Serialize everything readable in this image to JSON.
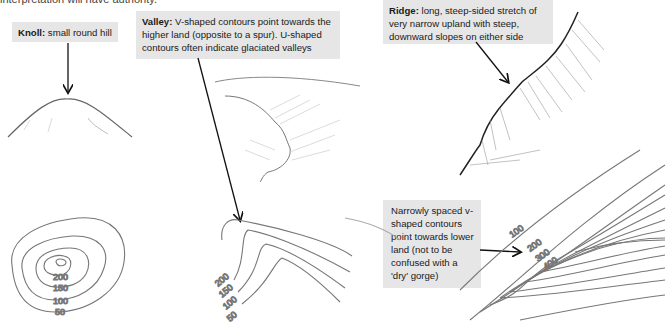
{
  "intro_fragment": "interpretation will have authority.",
  "callouts": {
    "knoll": {
      "title": "Knoll:",
      "text": " small round hill"
    },
    "valley": {
      "title": "Valley:",
      "text": " V-shaped contours point towards the higher land (opposite to a spur). U-shaped contours often indicate glaciated valleys"
    },
    "ridge": {
      "title": "Ridge:",
      "text": " long, steep-sided stretch of very narrow upland with steep, downward slopes on either side"
    },
    "gorge": {
      "text": "Narrowly spaced v-shaped contours point towards lower land (not to be confused with a 'dry' gorge)"
    }
  },
  "contour_labels": {
    "knoll": [
      "200",
      "150",
      "100",
      "50"
    ],
    "valley": [
      "200",
      "150",
      "100",
      "50"
    ],
    "spur": [
      "100",
      "200",
      "300",
      "400"
    ]
  },
  "colors": {
    "callout_bg": "#e6e6e6",
    "contour": "#777777",
    "arrow": "#111111"
  }
}
